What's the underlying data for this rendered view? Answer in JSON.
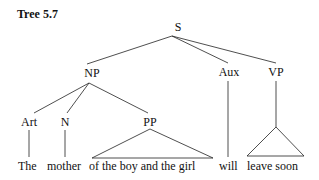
{
  "title": "Tree 5.7",
  "tree": {
    "root": "S",
    "nodes": {
      "S": "S",
      "NP": "NP",
      "Aux": "Aux",
      "VP": "VP",
      "Art": "Art",
      "N": "N",
      "PP": "PP"
    },
    "leaves": {
      "art": "The",
      "n": "mother",
      "pp": "of the boy and the girl",
      "aux": "will",
      "vp": "leave soon"
    },
    "structure": [
      {
        "parent": "S",
        "children": [
          "NP",
          "Aux",
          "VP"
        ]
      },
      {
        "parent": "NP",
        "children": [
          "Art",
          "N",
          "PP"
        ]
      },
      {
        "parent": "Art",
        "children": [
          "The"
        ]
      },
      {
        "parent": "N",
        "children": [
          "mother"
        ]
      },
      {
        "parent": "PP",
        "children": [
          "of the boy and the girl"
        ],
        "triangle": true
      },
      {
        "parent": "Aux",
        "children": [
          "will"
        ]
      },
      {
        "parent": "VP",
        "children": [
          "leave soon"
        ],
        "triangle": true
      }
    ]
  }
}
